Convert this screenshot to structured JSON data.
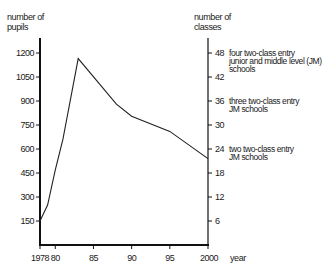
{
  "chart_data": {
    "type": "line",
    "title": "",
    "xlabel": "year",
    "ylabel": "number of pupils",
    "y2label": "number of classes",
    "x": [
      1978,
      1979,
      1980,
      1981,
      1983,
      1988,
      1990,
      1995,
      2000
    ],
    "series": [
      {
        "name": "number of pupils",
        "values": [
          150,
          250,
          470,
          660,
          1165,
          880,
          805,
          710,
          540
        ]
      }
    ],
    "xlim": [
      1978,
      2000
    ],
    "ylim": [
      0,
      1300
    ],
    "y2lim": [
      0,
      52
    ],
    "x_ticks": [
      "1978",
      "80",
      "85",
      "90",
      "95",
      "2000"
    ],
    "x_tick_values": [
      1978,
      1980,
      1985,
      1990,
      1995,
      2000
    ],
    "y_ticks": [
      "150",
      "300",
      "450",
      "600",
      "750",
      "900",
      "1050",
      "1200"
    ],
    "y_tick_values": [
      150,
      300,
      450,
      600,
      750,
      900,
      1050,
      1200
    ],
    "y2_ticks": [
      "6",
      "12",
      "18",
      "24",
      "30",
      "36",
      "42",
      "48"
    ],
    "y2_tick_values": [
      6,
      12,
      18,
      24,
      30,
      36,
      42,
      48
    ],
    "annotations": [
      {
        "y2": 48,
        "lines": [
          "four two-class entry",
          "junior and middle level (JM)",
          "schools"
        ]
      },
      {
        "y2": 36,
        "lines": [
          "three two-class entry",
          "JM schools"
        ]
      },
      {
        "y2": 24,
        "lines": [
          "two two-class entry",
          "JM schools"
        ]
      }
    ],
    "grid": false,
    "legend": "none"
  },
  "labels": {
    "y_axis_line1": "number of",
    "y_axis_line2": "pupils",
    "y2_axis_line1": "number of",
    "y2_axis_line2": "classes",
    "x_axis": "year"
  }
}
